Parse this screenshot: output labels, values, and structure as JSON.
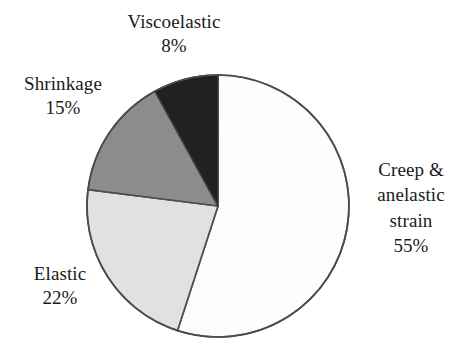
{
  "chart_data": {
    "type": "pie",
    "title": "",
    "categories": [
      "Creep & anelastic strain",
      "Elastic",
      "Shrinkage",
      "Viscoelastic"
    ],
    "values": [
      55,
      22,
      15,
      8
    ],
    "unit": "%",
    "legend": "none",
    "start_angle_deg": 0,
    "direction": "clockwise",
    "slices": [
      {
        "name": "Creep & anelastic strain",
        "value": 55,
        "value_label": "55%",
        "color": "#ffffff",
        "label_lines": [
          "Creep &",
          "anelastic",
          "strain",
          "55%"
        ]
      },
      {
        "name": "Elastic",
        "value": 22,
        "value_label": "22%",
        "color": "#e3e3e3",
        "label_lines": [
          "Elastic",
          "22%"
        ]
      },
      {
        "name": "Shrinkage",
        "value": 15,
        "value_label": "15%",
        "color": "#8b8b8b",
        "label_lines": [
          "Shrinkage",
          "15%"
        ]
      },
      {
        "name": "Viscoelastic",
        "value": 8,
        "value_label": "8%",
        "color": "#1c1c1c",
        "label_lines": [
          "Viscoelastic",
          "8%"
        ]
      }
    ]
  },
  "labels": {
    "viscoelastic": {
      "name": "Viscoelastic",
      "percent": "8%"
    },
    "shrinkage": {
      "name": "Shrinkage",
      "percent": "15%"
    },
    "elastic": {
      "name": "Elastic",
      "percent": "22%"
    },
    "creep": {
      "line1": "Creep &",
      "line2": "anelastic",
      "line3": "strain",
      "percent": "55%"
    }
  },
  "style": {
    "outline_color": "#4a4a4a",
    "background": "#ffffff",
    "text_color": "#1b1b1b"
  }
}
